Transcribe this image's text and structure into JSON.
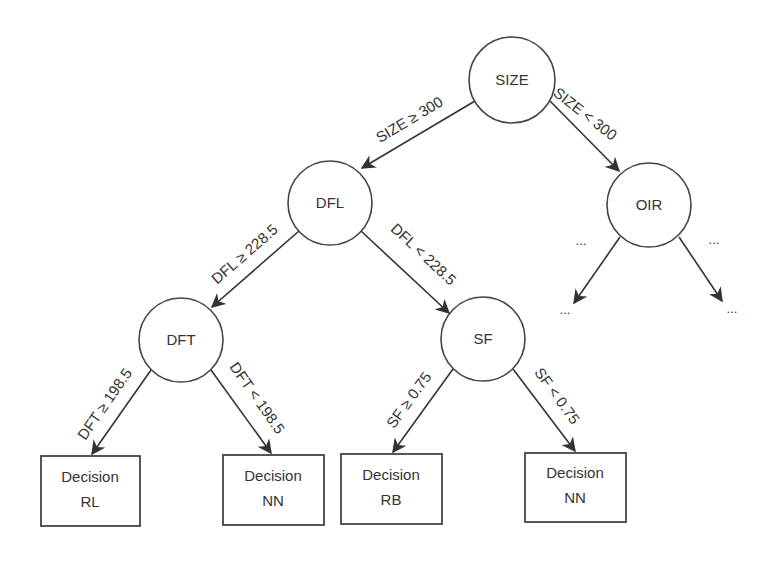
{
  "diagram": {
    "type": "decision-tree",
    "colors": {
      "stroke": "#444444",
      "text": "#333333",
      "background": "#ffffff"
    },
    "nodes": {
      "size": {
        "label": "SIZE"
      },
      "dfl": {
        "label": "DFL"
      },
      "oir": {
        "label": "OIR"
      },
      "dft": {
        "label": "DFT"
      },
      "sf": {
        "label": "SF"
      }
    },
    "edges": {
      "size_ge": {
        "label": "SIZE ≥ 300"
      },
      "size_lt": {
        "label": "SIZE < 300"
      },
      "dfl_ge": {
        "label": "DFL ≥ 228.5"
      },
      "dfl_lt": {
        "label": "DFL < 228.5"
      },
      "dft_ge": {
        "label": "DFT ≥ 198.5"
      },
      "dft_lt": {
        "label": "DFT < 198.5"
      },
      "sf_ge": {
        "label": "SF ≥ 0.75"
      },
      "sf_lt": {
        "label": "SF < 0.75"
      },
      "oir_left": {
        "label": "..."
      },
      "oir_right": {
        "label": "..."
      }
    },
    "leaves": [
      {
        "line1": "Decision",
        "line2": "RL"
      },
      {
        "line1": "Decision",
        "line2": "NN"
      },
      {
        "line1": "Decision",
        "line2": "RB"
      },
      {
        "line1": "Decision",
        "line2": "NN"
      }
    ],
    "oir_children": {
      "left": "...",
      "right": "..."
    }
  }
}
